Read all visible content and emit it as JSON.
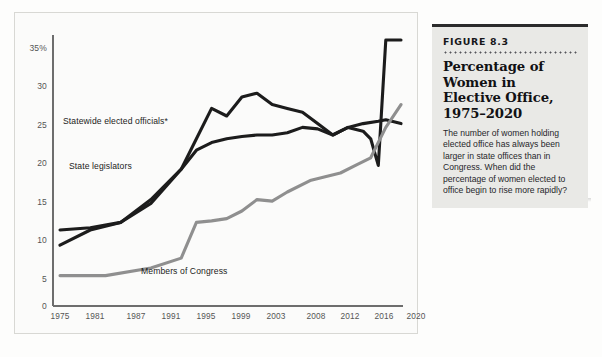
{
  "figure": {
    "number_label": "FIGURE 8.3",
    "title": "Percentage of Women in Elective Office, 1975–2020",
    "body": "The number of women holding elected office has always been larger in state offices than in Congress. When did the percentage of women elected to office begin to rise more rapidly?"
  },
  "chart_data": {
    "type": "line",
    "title": "Percentage of Women in Elective Office, 1975–2020",
    "xlabel": "",
    "ylabel": "",
    "ylim": [
      0,
      35
    ],
    "xlim": [
      1975,
      2020
    ],
    "grid": false,
    "legend": "inline-labels",
    "yticks": [
      0,
      5,
      10,
      15,
      20,
      25,
      30,
      35
    ],
    "ytick_labels": [
      "0",
      "5",
      "10",
      "15",
      "20",
      "25",
      "30",
      "35%"
    ],
    "xticks": [
      1975,
      1981,
      1987,
      1991,
      1995,
      1999,
      2003,
      2008,
      2012,
      2016,
      2020
    ],
    "xtick_labels": [
      "1975",
      "1981",
      "1987",
      "1991",
      "1995",
      "1999",
      "2003",
      "2008",
      "2012",
      "2016",
      "2020"
    ],
    "series": [
      {
        "name": "Statewide elected officials*",
        "color": "#1c1c1c",
        "label_position": {
          "x": 62,
          "y": 118
        },
        "x": [
          1975,
          1979,
          1983,
          1987,
          1991,
          1993,
          1995,
          1997,
          1999,
          2001,
          2003,
          2005,
          2007,
          2009,
          2011,
          2013,
          2015,
          2016,
          2017,
          2018,
          2020
        ],
        "y": [
          8.0,
          10.0,
          11.0,
          13.5,
          18.0,
          22.0,
          26.0,
          25.0,
          27.5,
          28.0,
          26.5,
          26.0,
          25.5,
          24.0,
          22.5,
          23.5,
          23.0,
          22.0,
          18.5,
          35.0,
          35.0
        ]
      },
      {
        "name": "State legislators",
        "color": "#1c1c1c",
        "label_position": {
          "x": 68,
          "y": 163
        },
        "x": [
          1975,
          1979,
          1983,
          1987,
          1991,
          1993,
          1995,
          1997,
          1999,
          2001,
          2003,
          2005,
          2007,
          2009,
          2011,
          2013,
          2015,
          2017,
          2018,
          2020
        ],
        "y": [
          10.0,
          10.3,
          11.0,
          14.0,
          18.0,
          20.5,
          21.5,
          22.0,
          22.3,
          22.5,
          22.5,
          22.8,
          23.5,
          23.3,
          22.5,
          23.5,
          24.0,
          24.3,
          24.5,
          24.0
        ]
      },
      {
        "name": "Members of Congress",
        "color": "#8f8f8f",
        "label_position": {
          "x": 140,
          "y": 267
        },
        "x": [
          1975,
          1981,
          1987,
          1991,
          1993,
          1995,
          1997,
          1999,
          2001,
          2003,
          2005,
          2008,
          2010,
          2012,
          2014,
          2016,
          2018,
          2020
        ],
        "y": [
          4.0,
          4.0,
          5.0,
          6.3,
          11.0,
          11.2,
          11.5,
          12.5,
          14.0,
          13.8,
          15.0,
          16.5,
          17.0,
          17.5,
          18.5,
          19.5,
          23.5,
          26.5
        ]
      }
    ]
  }
}
